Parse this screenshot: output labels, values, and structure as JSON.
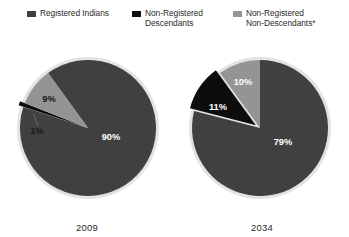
{
  "legend": {
    "items": [
      {
        "label": "Registered Indians",
        "color": "#404040",
        "swatch_name": "legend-swatch-registered-indians"
      },
      {
        "label": "Non-Registered\nDescendants",
        "color": "#0d0d0d",
        "swatch_name": "legend-swatch-non-registered-descendants"
      },
      {
        "label": "Non-Registered\nNon-Descendants*",
        "color": "#949494",
        "swatch_name": "legend-swatch-non-registered-non-descendants"
      }
    ]
  },
  "chart_data": {
    "type": "pie",
    "title": "",
    "subtitle": "",
    "xlabel": "",
    "ylabel": "",
    "legend_position": "top",
    "grid": false,
    "categories": [
      "Registered Indians",
      "Non-Registered Descendants",
      "Non-Registered Non-Descendants*"
    ],
    "colors": [
      "#404040",
      "#0d0d0d",
      "#949494"
    ],
    "charts": [
      {
        "name": "2009",
        "label": "2009",
        "values": [
          90,
          1,
          9
        ],
        "data_labels": [
          "90%",
          "1%",
          "9%"
        ],
        "exploded": [
          "Non-Registered Descendants"
        ],
        "start_angle_deg": 324
      },
      {
        "name": "2034",
        "label": "2034",
        "values": [
          79,
          11,
          10
        ],
        "data_labels": [
          "79%",
          "11%",
          "10%"
        ],
        "exploded": [
          "Non-Registered Descendants"
        ],
        "start_angle_deg": 0
      }
    ]
  },
  "pies": [
    {
      "year": "2009",
      "labels": {
        "major": "90%",
        "light": "9%",
        "dark": "1%"
      }
    },
    {
      "year": "2034",
      "labels": {
        "major": "79%",
        "light": "10%",
        "dark": "11%"
      }
    }
  ]
}
